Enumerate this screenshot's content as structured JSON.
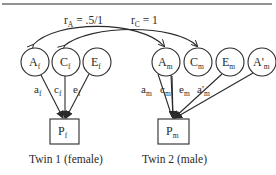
{
  "colors": {
    "stroke": "#2a2a2a",
    "rule": "#6e6e6e",
    "background": "#ffffff"
  },
  "correlations": {
    "rA": {
      "base": "r",
      "sub": "A",
      "value": " = .5/1"
    },
    "rC": {
      "base": "r",
      "sub": "C",
      "value": " = 1"
    }
  },
  "twin1": {
    "label": "Twin 1 (female)",
    "latents": [
      {
        "base": "A",
        "sub": "f"
      },
      {
        "base": "C",
        "sub": "f"
      },
      {
        "base": "E",
        "sub": "f"
      }
    ],
    "paths": [
      {
        "base": "a",
        "sub": "f"
      },
      {
        "base": "c",
        "sub": "f"
      },
      {
        "base": "e",
        "sub": "f"
      }
    ],
    "phenotype": {
      "base": "P",
      "sub": "f"
    }
  },
  "twin2": {
    "label": "Twin 2 (male)",
    "latents": [
      {
        "base": "A",
        "sub": "m"
      },
      {
        "base": "C",
        "sub": "m"
      },
      {
        "base": "E",
        "sub": "m"
      },
      {
        "base": "A'",
        "sub": "m"
      }
    ],
    "paths": [
      {
        "base": "a",
        "sub": "m"
      },
      {
        "base": "c",
        "sub": "m"
      },
      {
        "base": "e",
        "sub": "m"
      },
      {
        "base": "a'",
        "sub": "m"
      }
    ],
    "phenotype": {
      "base": "P",
      "sub": "m"
    }
  }
}
